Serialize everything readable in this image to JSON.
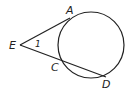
{
  "diagram": {
    "labels": {
      "A": "A",
      "E": "E",
      "C": "C",
      "D": "D",
      "angle": "1"
    },
    "stroke_color": "#222222"
  }
}
